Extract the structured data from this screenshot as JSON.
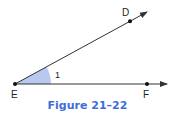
{
  "figure": {
    "caption": "Figure 21–22",
    "caption_color": "#3d6fd6",
    "angle_fill": "#b8c8ee",
    "line_color": "#333333",
    "points": {
      "D": {
        "label": "D"
      },
      "E": {
        "label": "E"
      },
      "F": {
        "label": "F"
      }
    },
    "angle_label": "1"
  }
}
